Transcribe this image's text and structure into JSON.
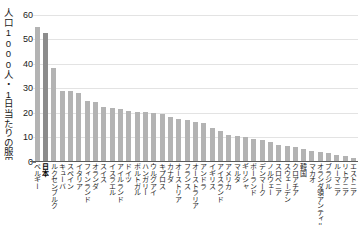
{
  "chart_data": {
    "type": "bar",
    "title": "",
    "subtitle": "",
    "xlabel": "",
    "ylabel": "人口1000人・1日当たりの服用量",
    "ylim": [
      0,
      62
    ],
    "yticks": [
      0,
      10,
      20,
      30,
      40,
      50,
      60
    ],
    "ytick_labels": [
      "0",
      "10",
      "20",
      "30",
      "40",
      "50",
      "60"
    ],
    "grid": true,
    "legend": "none",
    "highlight_category": "日本",
    "bar_color": "#b3b3b3",
    "highlight_color": "#8c8c8c",
    "categories": [
      "ベルギー",
      "日本",
      "ルクセンブルク",
      "キューバ",
      "スペイン",
      "イタリア",
      "フィンランド",
      "オランダ",
      "スイス",
      "イスラエル",
      "アイルランド",
      "ドイツ",
      "ポルトガル",
      "ハンガリー",
      "ウルグアイ",
      "キプロス",
      "カナダ",
      "オーストリア",
      "フランス",
      "オーストラリア",
      "アンドラ",
      "イギリス",
      "アイスランド",
      "アメリカ",
      "マルタ",
      "ギリシャ",
      "ポーランド",
      "デンマーク",
      "ノルウェー",
      "スロベニア",
      "スウェーデン",
      "クロアチア",
      "韓国",
      "マカオ",
      "オランダ領アンティル",
      "ブラジル",
      "ルーマニア",
      "リトアニア",
      "エストニア"
    ],
    "values": [
      55.0,
      52.5,
      38.5,
      29.0,
      29.0,
      28.0,
      25.0,
      24.5,
      22.5,
      22.0,
      21.5,
      21.0,
      20.5,
      20.5,
      20.0,
      19.5,
      18.5,
      17.5,
      17.0,
      16.5,
      16.0,
      14.0,
      12.5,
      11.0,
      10.5,
      10.0,
      9.5,
      9.0,
      8.0,
      7.0,
      6.5,
      6.0,
      5.5,
      4.5,
      4.0,
      3.5,
      3.0,
      2.5,
      1.5
    ]
  }
}
